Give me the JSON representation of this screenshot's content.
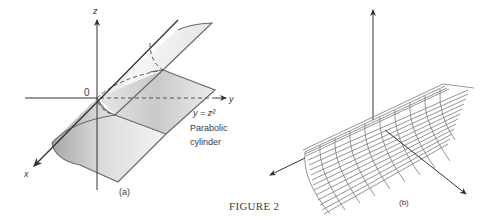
{
  "figure": {
    "caption": "FIGURE 2",
    "panel_a": {
      "label": "(a)",
      "axes": {
        "x": "x",
        "y": "y",
        "z": "z",
        "origin": "0"
      },
      "equation": "y = z²",
      "surface_name_line1": "Parabolic",
      "surface_name_line2": "cylinder"
    },
    "panel_b": {
      "label": "(b)"
    }
  },
  "colors": {
    "line": "#4a4a4a",
    "surface_edge": "#6a6a6a",
    "shade_dark": "#9a9a9a",
    "shade_light": "#f2f2f2",
    "mesh": "#7a7a7a"
  }
}
